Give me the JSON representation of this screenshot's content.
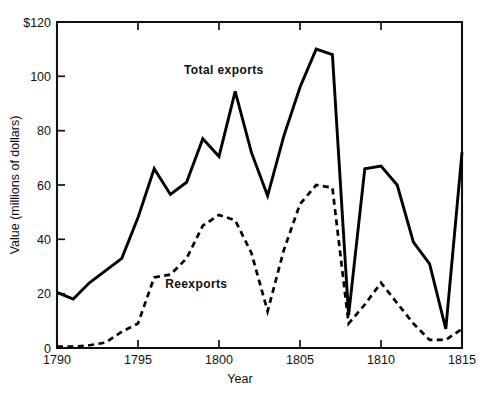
{
  "chart_data": {
    "type": "line",
    "title": "",
    "xlabel": "Year",
    "ylabel": "Value (millions of dollars)",
    "xlim": [
      1790,
      1815
    ],
    "ylim": [
      0,
      120
    ],
    "grid": false,
    "legend_position": "inline-annotation",
    "x": [
      1790,
      1791,
      1792,
      1793,
      1794,
      1795,
      1796,
      1797,
      1798,
      1799,
      1800,
      1801,
      1802,
      1803,
      1804,
      1805,
      1806,
      1807,
      1808,
      1809,
      1810,
      1811,
      1812,
      1813,
      1814,
      1815
    ],
    "xticks": [
      "1790",
      "1795",
      "1800",
      "1805",
      "1810",
      "1815"
    ],
    "xtick_values": [
      1790,
      1795,
      1800,
      1805,
      1810,
      1815
    ],
    "yticks": [
      "0",
      "20",
      "40",
      "60",
      "80",
      "100",
      "$120"
    ],
    "ytick_values": [
      0,
      20,
      40,
      60,
      80,
      100,
      120
    ],
    "series": [
      {
        "name": "Total exports",
        "style": "solid",
        "label_x": 1800.3,
        "label_y": 101,
        "values": [
          20.5,
          18.0,
          24.0,
          28.5,
          33.0,
          48.0,
          66.0,
          56.5,
          61.0,
          77.0,
          70.5,
          94.5,
          72.0,
          56.0,
          78.0,
          96.0,
          110.0,
          108.0,
          12.0,
          66.0,
          67.0,
          60.0,
          39.0,
          31.0,
          7.0,
          72.0
        ]
      },
      {
        "name": "Reexports",
        "style": "dashed",
        "label_x": 1798.6,
        "label_y": 22,
        "values": [
          0.5,
          0.5,
          1.0,
          2.0,
          6.0,
          9.0,
          26.0,
          27.0,
          33.0,
          45.0,
          49.0,
          47.0,
          35.0,
          13.5,
          36.0,
          53.0,
          60.0,
          59.0,
          9.0,
          16.0,
          24.0,
          16.5,
          9.0,
          3.0,
          3.0,
          7.0
        ]
      }
    ]
  },
  "axes": {
    "y_axis_title": "Value (millions of dollars)",
    "x_axis_title": "Year"
  }
}
